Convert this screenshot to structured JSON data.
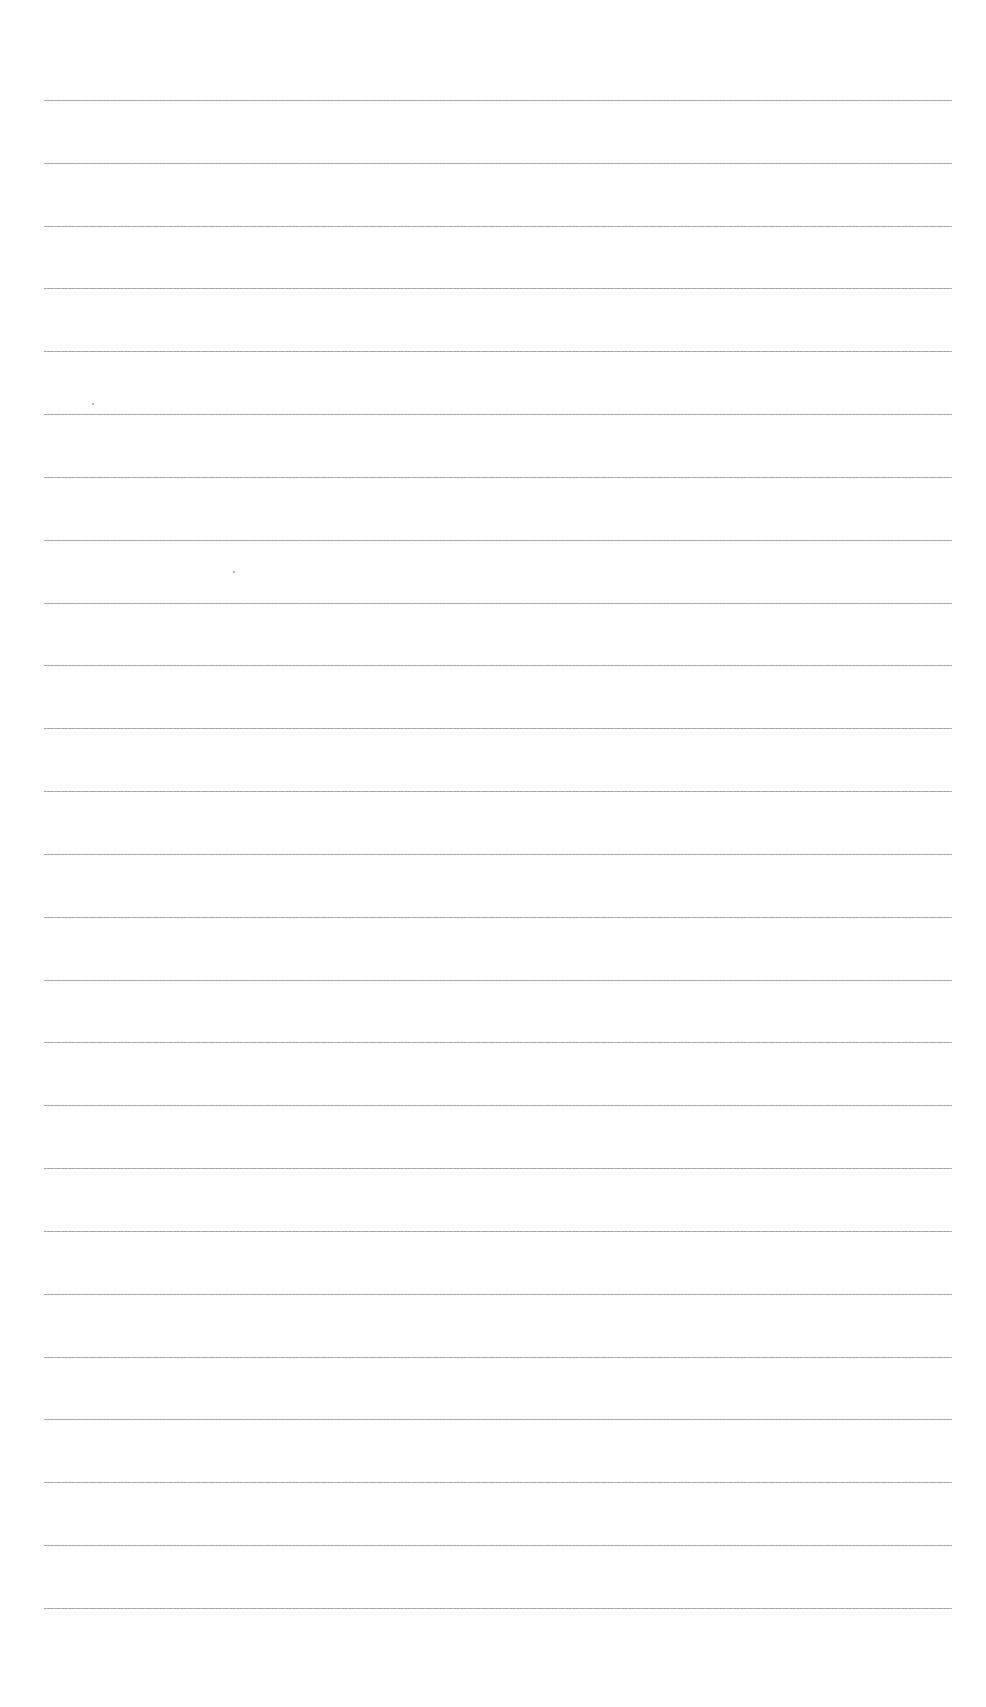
{
  "document": {
    "type": "ruled-paper",
    "background_color": "#fefefe",
    "line_color": "#9a9a9a",
    "line_count": 25,
    "line_left_px": 44,
    "line_right_px": 952,
    "first_line_y_px": 100,
    "last_line_y_px": 1608,
    "line_spacing_px": 62.83,
    "text_content": ""
  },
  "specks": [
    {
      "x": 92,
      "y": 403
    },
    {
      "x": 233,
      "y": 571
    }
  ]
}
